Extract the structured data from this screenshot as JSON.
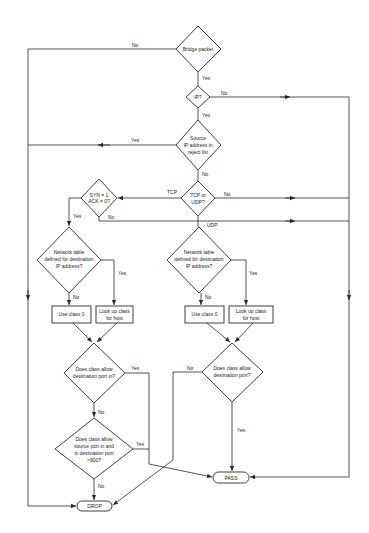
{
  "diagram": {
    "type": "flowchart",
    "colors": {
      "background": "#ffffff",
      "stroke": "#2a2a2a",
      "text": "#222222"
    },
    "nodes": {
      "bridge": {
        "shape": "decision",
        "lines": [
          "Bridge packet"
        ]
      },
      "ip": {
        "shape": "decision",
        "lines": [
          "IP?"
        ]
      },
      "reject": {
        "shape": "decision",
        "lines": [
          "Source",
          "IP address in",
          "reject list"
        ]
      },
      "tcpudp": {
        "shape": "decision",
        "lines": [
          "TCP or",
          "UDP?"
        ]
      },
      "syn": {
        "shape": "decision",
        "lines": [
          "SYN = 1",
          "ACK = 0?"
        ]
      },
      "net_tcp": {
        "shape": "decision",
        "lines": [
          "Network table",
          "defined for destination",
          "IP address?"
        ]
      },
      "net_udp": {
        "shape": "decision",
        "lines": [
          "Network table",
          "defined for destination",
          "IP address?"
        ]
      },
      "class0_tcp": {
        "shape": "process",
        "lines": [
          "Use class 0"
        ]
      },
      "lookup_tcp": {
        "shape": "process",
        "lines": [
          "Look up class",
          "for host"
        ]
      },
      "class0_udp": {
        "shape": "process",
        "lines": [
          "Use class 0"
        ]
      },
      "lookup_udp": {
        "shape": "process",
        "lines": [
          "Look up class",
          "for host"
        ]
      },
      "dport_in": {
        "shape": "decision",
        "lines": [
          "Does class allow",
          "destination port in?"
        ]
      },
      "sport_in": {
        "shape": "decision",
        "lines": [
          "Does class allow",
          "source port in and",
          "is destination port",
          ">900?"
        ]
      },
      "dport": {
        "shape": "decision",
        "lines": [
          "Does class allow",
          "destination port?"
        ]
      },
      "pass": {
        "shape": "terminal",
        "lines": [
          "PASS"
        ]
      },
      "drop": {
        "shape": "terminal",
        "lines": [
          "DROP"
        ]
      }
    },
    "edge_labels": {
      "bridge_no": "No",
      "bridge_yes": "Yes",
      "ip_no": "No",
      "ip_yes": "Yes",
      "reject_yes": "Yes",
      "reject_no": "No",
      "tcp": "TCP",
      "tcpudp_no": "No",
      "udp": "UDP",
      "syn_yes": "Yes",
      "syn_no": "No",
      "net_tcp_yes": "Yes",
      "net_tcp_no": "No",
      "net_udp_yes": "Yes",
      "net_udp_no": "No",
      "dport_in_yes": "Yes",
      "dport_in_no": "No",
      "sport_in_yes": "Yes",
      "sport_in_no": "No",
      "dport_no": "No",
      "dport_yes": "Yes"
    }
  }
}
